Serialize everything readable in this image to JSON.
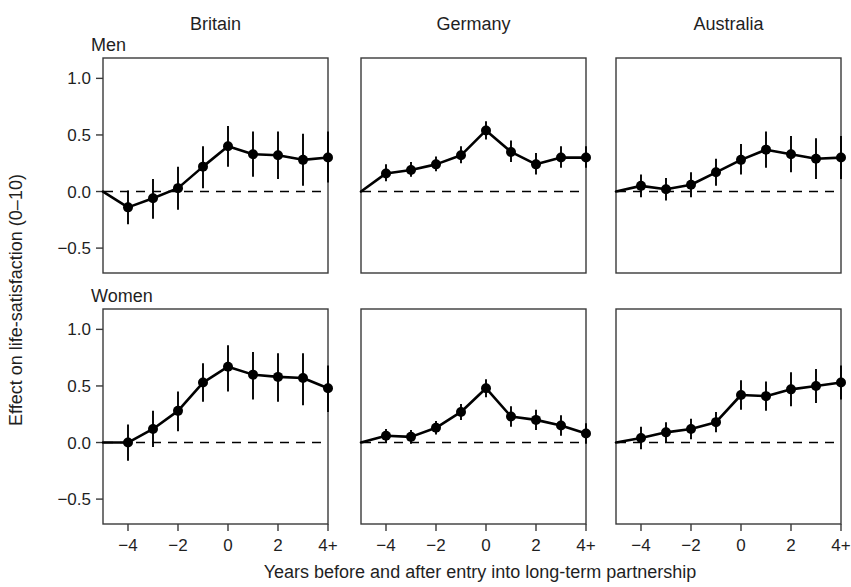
{
  "figure": {
    "xlabel": "Years before and after entry into long-term partnership",
    "ylabel": "Effect on life-satisfaction (0–10)",
    "row_labels": [
      "Men",
      "Women"
    ],
    "column_titles": [
      "Britain",
      "Germany",
      "Australia"
    ],
    "y_tick_labels": [
      "1.0",
      "0.5",
      "0.0",
      "−0.5"
    ],
    "x_tick_labels": [
      "−4",
      "−2",
      "0",
      "2",
      "4+"
    ],
    "colors": {
      "line": "#000000",
      "marker": "#000000",
      "frame": "#3a3a3a",
      "background": "#ffffff",
      "text": "#1f1f1f"
    }
  },
  "chart_data": {
    "type": "line",
    "title": "",
    "subtitle": "",
    "xlabel": "Years before and after entry into long-term partnership",
    "ylabel": "Effect on life-satisfaction (0–10)",
    "ylim": [
      -0.72,
      1.18
    ],
    "xlim": [
      -5,
      4
    ],
    "grid": false,
    "legend": "none",
    "y_ticks": [
      1.0,
      0.5,
      0.0,
      -0.5
    ],
    "x_ticks": [
      -4,
      -2,
      0,
      2,
      4
    ],
    "x_tick_labels": [
      "−4",
      "−2",
      "0",
      "2",
      "4+"
    ],
    "x": [
      -5,
      -4,
      -3,
      -2,
      -1,
      0,
      1,
      2,
      3,
      4
    ],
    "x_note": "x = -5 is the anchored reference point fixed at 0 (no marker, no error bar); x = 4 is labelled 4+",
    "reference_line": {
      "y": 0.0,
      "style": "dashed"
    },
    "panels": [
      {
        "row": "Men",
        "column": "Britain",
        "values": [
          0.0,
          -0.14,
          -0.06,
          0.03,
          0.22,
          0.4,
          0.33,
          0.32,
          0.28,
          0.3
        ],
        "ci_low": [
          null,
          -0.29,
          -0.24,
          -0.16,
          0.03,
          0.22,
          0.13,
          0.11,
          0.05,
          0.08
        ],
        "ci_high": [
          null,
          0.01,
          0.11,
          0.22,
          0.4,
          0.58,
          0.53,
          0.53,
          0.51,
          0.53
        ]
      },
      {
        "row": "Men",
        "column": "Germany",
        "values": [
          0.0,
          0.16,
          0.19,
          0.24,
          0.32,
          0.54,
          0.35,
          0.24,
          0.3,
          0.3
        ],
        "ci_low": [
          null,
          0.09,
          0.13,
          0.18,
          0.25,
          0.46,
          0.26,
          0.15,
          0.21,
          0.21
        ],
        "ci_high": [
          null,
          0.24,
          0.26,
          0.31,
          0.4,
          0.62,
          0.45,
          0.34,
          0.4,
          0.4
        ]
      },
      {
        "row": "Men",
        "column": "Australia",
        "values": [
          0.0,
          0.05,
          0.02,
          0.06,
          0.17,
          0.28,
          0.37,
          0.33,
          0.29,
          0.3
        ],
        "ci_low": [
          null,
          -0.05,
          -0.08,
          -0.05,
          0.05,
          0.15,
          0.21,
          0.17,
          0.11,
          0.11
        ],
        "ci_high": [
          null,
          0.15,
          0.12,
          0.17,
          0.29,
          0.42,
          0.53,
          0.49,
          0.47,
          0.49
        ]
      },
      {
        "row": "Women",
        "column": "Britain",
        "values": [
          0.0,
          0.0,
          0.12,
          0.28,
          0.53,
          0.67,
          0.6,
          0.58,
          0.57,
          0.48
        ],
        "ci_low": [
          null,
          -0.16,
          -0.04,
          0.1,
          0.36,
          0.45,
          0.38,
          0.36,
          0.33,
          0.27
        ],
        "ci_high": [
          null,
          0.16,
          0.28,
          0.45,
          0.7,
          0.86,
          0.8,
          0.79,
          0.79,
          0.68
        ]
      },
      {
        "row": "Women",
        "column": "Germany",
        "values": [
          0.0,
          0.06,
          0.05,
          0.13,
          0.27,
          0.48,
          0.23,
          0.2,
          0.15,
          0.08
        ],
        "ci_low": [
          null,
          0.0,
          -0.01,
          0.07,
          0.2,
          0.4,
          0.14,
          0.11,
          0.06,
          -0.01
        ],
        "ci_high": [
          null,
          0.12,
          0.11,
          0.19,
          0.34,
          0.56,
          0.32,
          0.29,
          0.24,
          0.17
        ]
      },
      {
        "row": "Women",
        "column": "Australia",
        "values": [
          0.0,
          0.04,
          0.09,
          0.12,
          0.18,
          0.42,
          0.41,
          0.47,
          0.5,
          0.53
        ],
        "ci_low": [
          null,
          -0.06,
          0.0,
          0.03,
          0.09,
          0.29,
          0.28,
          0.32,
          0.35,
          0.38
        ],
        "ci_high": [
          null,
          0.14,
          0.18,
          0.21,
          0.27,
          0.55,
          0.54,
          0.62,
          0.65,
          0.68
        ]
      }
    ]
  }
}
